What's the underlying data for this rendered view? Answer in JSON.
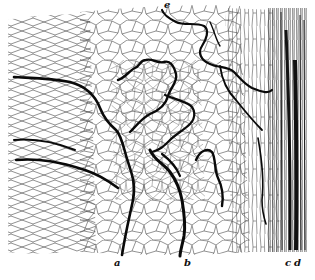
{
  "figure": {
    "labels": {
      "a": "a",
      "b": "b",
      "c": "c",
      "d": "d",
      "e": "e"
    },
    "caption": "",
    "colors": {
      "background": "#ffffff",
      "cell_wall": "#3a3a3a",
      "channel": "#0a0a0a"
    }
  }
}
